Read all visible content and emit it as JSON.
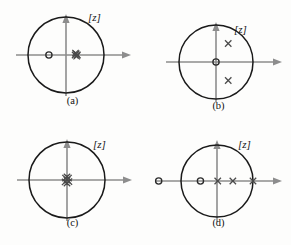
{
  "figure": {
    "kind": "pole-zero-plots",
    "panel_count": 4,
    "colors": {
      "background": "#fdfdfc",
      "axis": "#8d8d8d",
      "circle": "#1a1a1a",
      "pole": "#4a4a4a",
      "zero": "#2b2b2b",
      "text": "#121212"
    }
  },
  "chart_data": {
    "type": "scatter",
    "title": "",
    "xlabel": "",
    "ylabel": "",
    "xlim": [
      -2.0,
      2.0
    ],
    "ylim": [
      -1.55,
      1.55
    ],
    "grid": false,
    "legend": null,
    "plane_label": "[z]",
    "marker_legend": {
      "pole": "x",
      "zero": "o"
    },
    "panels": [
      {
        "id": "a",
        "caption": "(a)",
        "plane_label": "[z]",
        "unit_circle_radius": 1.0,
        "zeros": [
          {
            "re": -0.45,
            "im": 0.0,
            "multiplicity": 1
          }
        ],
        "poles": [
          {
            "re": 0.24,
            "im": 0.0,
            "multiplicity": 1
          },
          {
            "re": 0.27,
            "im": 0.03,
            "multiplicity": 1
          },
          {
            "re": 0.28,
            "im": -0.03,
            "multiplicity": 1
          },
          {
            "re": 0.25,
            "im": 0.05,
            "multiplicity": 1
          },
          {
            "re": 0.3,
            "im": 0.0,
            "multiplicity": 1
          }
        ],
        "note": "cluster of coincident poles just right of origin"
      },
      {
        "id": "b",
        "caption": "(b)",
        "plane_label": "[z]",
        "unit_circle_radius": 1.0,
        "zeros": [
          {
            "re": 0.0,
            "im": 0.0,
            "multiplicity": 1
          }
        ],
        "poles": [
          {
            "re": 0.33,
            "im": 0.5,
            "multiplicity": 1
          },
          {
            "re": 0.33,
            "im": -0.5,
            "multiplicity": 1
          }
        ],
        "note": "complex conjugate pole pair inside unit circle, zero at origin"
      },
      {
        "id": "c",
        "caption": "(c)",
        "plane_label": "[z]",
        "unit_circle_radius": 1.0,
        "zeros": [],
        "poles": [
          {
            "re": 0.0,
            "im": 0.0,
            "multiplicity": 1
          },
          {
            "re": 0.04,
            "im": 0.05,
            "multiplicity": 1
          },
          {
            "re": -0.04,
            "im": 0.05,
            "multiplicity": 1
          },
          {
            "re": 0.05,
            "im": -0.04,
            "multiplicity": 1
          },
          {
            "re": -0.05,
            "im": -0.05,
            "multiplicity": 1
          },
          {
            "re": 0.0,
            "im": 0.08,
            "multiplicity": 1
          },
          {
            "re": 0.0,
            "im": -0.08,
            "multiplicity": 1
          }
        ],
        "note": "dense cluster of poles at the origin"
      },
      {
        "id": "d",
        "caption": "(d)",
        "plane_label": "[z]",
        "unit_circle_radius": 1.0,
        "zeros": [
          {
            "re": -1.62,
            "im": 0.0,
            "multiplicity": 1
          },
          {
            "re": -0.46,
            "im": 0.0,
            "multiplicity": 1
          }
        ],
        "poles": [
          {
            "re": 0.02,
            "im": 0.0,
            "multiplicity": 1
          },
          {
            "re": 0.44,
            "im": 0.0,
            "multiplicity": 1
          },
          {
            "re": 1.0,
            "im": 0.0,
            "multiplicity": 1
          }
        ],
        "note": "all real zeros and poles; outermost pole sits on the unit circle"
      }
    ]
  }
}
